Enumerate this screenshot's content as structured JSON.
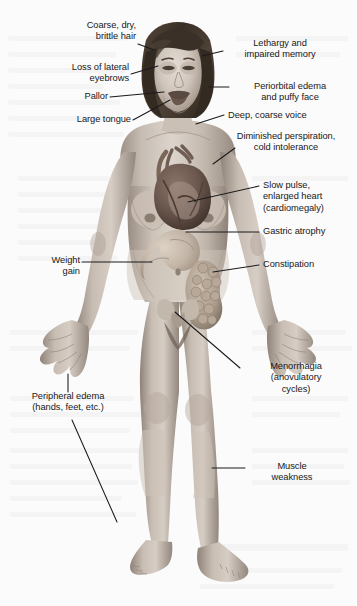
{
  "figure": {
    "background_color": "#fbfbfb",
    "ink_color": "#18181a",
    "leader_line_color": "#1a1a1c",
    "skin_light": "#d8cfc6",
    "skin_mid": "#b4a89c",
    "skin_shadow": "#8e8176",
    "hair_color": "#3b3128",
    "heart_color": "#6d5a52",
    "viscera_color": "#bfae9f"
  },
  "labels": [
    {
      "id": "coarse-hair",
      "side": "left",
      "align": "right",
      "text": "Coarse, dry,\nbrittle hair"
    },
    {
      "id": "loss-eyebrows",
      "side": "left",
      "align": "right",
      "text": "Loss of lateral\neyebrows"
    },
    {
      "id": "pallor",
      "side": "left",
      "align": "right",
      "text": "Pallor"
    },
    {
      "id": "large-tongue",
      "side": "left",
      "align": "right",
      "text": "Large tongue"
    },
    {
      "id": "weight-gain",
      "side": "left",
      "align": "right",
      "text": "Weight\ngain"
    },
    {
      "id": "peripheral-edema",
      "side": "left",
      "align": "center",
      "text": "Peripheral edema\n(hands, feet, etc.)"
    },
    {
      "id": "lethargy",
      "side": "right",
      "align": "center",
      "text": "Lethargy and\nimpaired memory"
    },
    {
      "id": "periorbital-edema",
      "side": "right",
      "align": "center",
      "text": "Periorbital edema\nand puffy face"
    },
    {
      "id": "deep-voice",
      "side": "right",
      "align": "left",
      "text": "Deep, coarse voice"
    },
    {
      "id": "diminished-persp",
      "side": "right",
      "align": "center",
      "text": "Diminished perspiration,\ncold intolerance"
    },
    {
      "id": "slow-pulse",
      "side": "right",
      "align": "left",
      "text": "Slow pulse,\nenlarged heart\n(cardiomegaly)"
    },
    {
      "id": "gastric-atrophy",
      "side": "right",
      "align": "left",
      "text": "Gastric atrophy"
    },
    {
      "id": "constipation",
      "side": "right",
      "align": "left",
      "text": "Constipation"
    },
    {
      "id": "menorrhagia",
      "side": "right",
      "align": "center",
      "text": "Menorrhagia\n(anovulatory\ncycles)"
    },
    {
      "id": "muscle-weakness",
      "side": "right",
      "align": "center",
      "text": "Muscle\nweakness"
    }
  ]
}
